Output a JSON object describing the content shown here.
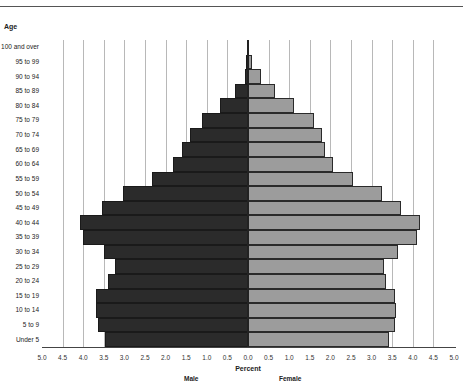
{
  "chart_data": {
    "type": "bar",
    "orientation": "horizontal",
    "subtype": "population-pyramid",
    "title": "",
    "ylabel": "Age",
    "xlabel": "Percent",
    "side_labels": {
      "left": "Male",
      "right": "Female"
    },
    "xlim": [
      -5.0,
      5.0
    ],
    "x_ticks": [
      "5.0",
      "4.5",
      "4.0",
      "3.5",
      "3.0",
      "2.5",
      "2.0",
      "1.5",
      "1.0",
      "0.5",
      "0.0",
      "0.5",
      "1.0",
      "1.5",
      "2.0",
      "2.5",
      "3.0",
      "3.5",
      "4.0",
      "4.5",
      "5.0"
    ],
    "grid": true,
    "categories": [
      "100 and over",
      "95 to 99",
      "90 to 94",
      "85 to 89",
      "80 to 84",
      "75 to 79",
      "70 to 74",
      "65 to 69",
      "60 to 64",
      "55 to 59",
      "50 to 54",
      "45 to 49",
      "40 to 44",
      "35 to 39",
      "30 to 34",
      "25 to 29",
      "20 to 24",
      "15 to 19",
      "10 to 14",
      "5 to 9",
      "Under 5"
    ],
    "series": [
      {
        "name": "Male",
        "color": "#2b2b2b",
        "values": [
          0.02,
          0.04,
          0.08,
          0.32,
          0.69,
          1.12,
          1.4,
          1.59,
          1.83,
          2.32,
          3.04,
          3.55,
          4.07,
          4.0,
          3.5,
          3.22,
          3.41,
          3.7,
          3.68,
          3.64,
          3.47
        ]
      },
      {
        "name": "Female",
        "color": "#9c9c9c",
        "values": [
          0.03,
          0.1,
          0.31,
          0.65,
          1.12,
          1.59,
          1.79,
          1.87,
          2.07,
          2.54,
          3.26,
          3.72,
          4.18,
          4.1,
          3.63,
          3.3,
          3.35,
          3.57,
          3.59,
          3.57,
          3.43
        ]
      }
    ]
  },
  "labels": {
    "age_title": "Age",
    "percent": "Percent",
    "male": "Male",
    "female": "Female"
  }
}
